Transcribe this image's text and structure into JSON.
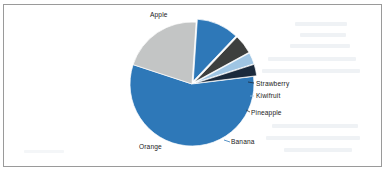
{
  "chart_data": {
    "type": "pie",
    "title": "",
    "subtitle": "",
    "xlabel": "",
    "ylabel": "",
    "legend_position": "none",
    "grid": false,
    "labels_shown": true,
    "categories": [
      "Apple",
      "Orange",
      "Banana",
      "Pineapple",
      "Kiwifruit",
      "Strawberry"
    ],
    "values": [
      57,
      21,
      11,
      5,
      3,
      3
    ],
    "colors": [
      "#2E78B8",
      "#C3C5C5",
      "#2E78B8",
      "#3D3F3E",
      "#9FC5E3",
      "#1B2A3C"
    ],
    "slices": [
      {
        "label": "Apple",
        "value": 57,
        "color": "#2E78B8",
        "exploded": false
      },
      {
        "label": "Orange",
        "value": 21,
        "color": "#C3C5C5",
        "exploded": false
      },
      {
        "label": "Banana",
        "value": 11,
        "color": "#2E78B8",
        "exploded": true
      },
      {
        "label": "Pineapple",
        "value": 5,
        "color": "#3D3F3E",
        "exploded": true
      },
      {
        "label": "Kiwifruit",
        "value": 3,
        "color": "#9FC5E3",
        "exploded": true
      },
      {
        "label": "Strawberry",
        "value": 3,
        "color": "#1B2A3C",
        "exploded": true
      }
    ]
  },
  "chart": {
    "labels": {
      "apple": "Apple",
      "orange": "Orange",
      "banana": "Banana",
      "pineapple": "Pineapple",
      "kiwifruit": "Kiwifruit",
      "strawberry": "Strawberry"
    },
    "frame_color": "#9a9a9a",
    "background": "#ffffff"
  }
}
